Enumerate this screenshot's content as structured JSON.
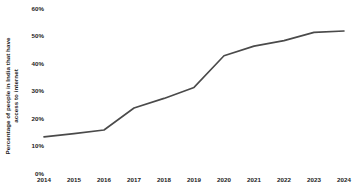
{
  "chart_data": {
    "type": "line",
    "title": "",
    "subtitle": "",
    "xlabel": "",
    "ylabel_lines": [
      "Percentage of people in India that have",
      "access to internet"
    ],
    "ylabel": "Percentage of people in India that have access to internet",
    "categories": [
      "2014",
      "2015",
      "2016",
      "2017",
      "2018",
      "2019",
      "2020",
      "2021",
      "2022",
      "2023",
      "2024"
    ],
    "x": [
      2014,
      2015,
      2016,
      2017,
      2018,
      2019,
      2020,
      2021,
      2022,
      2023,
      2024
    ],
    "values": [
      13.5,
      14.7,
      16.0,
      24.0,
      27.5,
      31.5,
      43.0,
      46.5,
      48.5,
      51.5,
      52.0
    ],
    "series": [
      {
        "name": "Percentage of people in India that have access to internet",
        "values": [
          13.5,
          14.7,
          16.0,
          24.0,
          27.5,
          31.5,
          43.0,
          46.5,
          48.5,
          51.5,
          52.0
        ],
        "color": "#4a4a4a"
      }
    ],
    "ylim": [
      0,
      60
    ],
    "yticks": [
      0,
      10,
      20,
      30,
      40,
      50,
      60
    ],
    "ytick_labels": [
      "0%",
      "10%",
      "20%",
      "30%",
      "40%",
      "50%",
      "60%"
    ],
    "xtick_labels": [
      "2014",
      "2015",
      "2016",
      "2017",
      "2018",
      "2019",
      "2020",
      "2021",
      "2022",
      "2023",
      "2024"
    ],
    "grid": false,
    "legend": false,
    "legend_position": "none",
    "line_color": "#4a4a4a",
    "line_width": 1.6,
    "markers": false,
    "background_color": "#ffffff",
    "text_color": "#1a1a1a",
    "annotations": []
  }
}
